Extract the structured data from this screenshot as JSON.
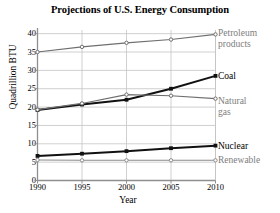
{
  "chart_data": {
    "type": "line",
    "title": "Projections of U.S. Energy Consumption",
    "xlabel": "Year",
    "ylabel": "Quadrillion BTU",
    "x": [
      1990,
      1995,
      2000,
      2005,
      2010
    ],
    "xticklabels": [
      "1990",
      "1995",
      "2000",
      "2005",
      "2010"
    ],
    "yticklabels": [
      "0",
      "5",
      "10",
      "15",
      "20",
      "25",
      "30",
      "35",
      "40"
    ],
    "yticks": [
      0,
      5,
      10,
      15,
      20,
      25,
      30,
      35,
      40
    ],
    "xlim": [
      1990,
      2010
    ],
    "ylim": [
      0,
      41
    ],
    "grid": true,
    "legend_position": "right-inline-labels",
    "series": [
      {
        "name": "Petroleum products",
        "label_lines": [
          "Petroleum",
          "products"
        ],
        "values": [
          35.0,
          36.4,
          37.5,
          38.4,
          39.8
        ],
        "color": "#6f6f6f",
        "emphasis": "light"
      },
      {
        "name": "Coal",
        "label_lines": [
          "Coal"
        ],
        "values": [
          19.2,
          20.7,
          22.0,
          25.0,
          28.5
        ],
        "color": "#111111",
        "emphasis": "bold"
      },
      {
        "name": "Natural gas",
        "label_lines": [
          "Natural",
          "gas"
        ],
        "values": [
          19.3,
          21.0,
          23.4,
          23.1,
          22.3
        ],
        "color": "#6f6f6f",
        "emphasis": "light"
      },
      {
        "name": "Nuclear",
        "label_lines": [
          "Nuclear"
        ],
        "values": [
          6.7,
          7.3,
          8.0,
          8.8,
          9.5
        ],
        "color": "#111111",
        "emphasis": "bold"
      },
      {
        "name": "Renewable",
        "label_lines": [
          "Renewable"
        ],
        "values": [
          5.6,
          5.5,
          5.5,
          5.5,
          5.5
        ],
        "color": "#8a8a8a",
        "emphasis": "light"
      }
    ]
  },
  "colors": {
    "axis": "#8f8f8f",
    "grid": "#c4c4c4",
    "dark_series": "#111111",
    "light_series": "#6f6f6f",
    "renewable_series": "#8a8a8a",
    "text": "#000000",
    "muted_text": "#7d7d7d",
    "background": "#ffffff"
  }
}
